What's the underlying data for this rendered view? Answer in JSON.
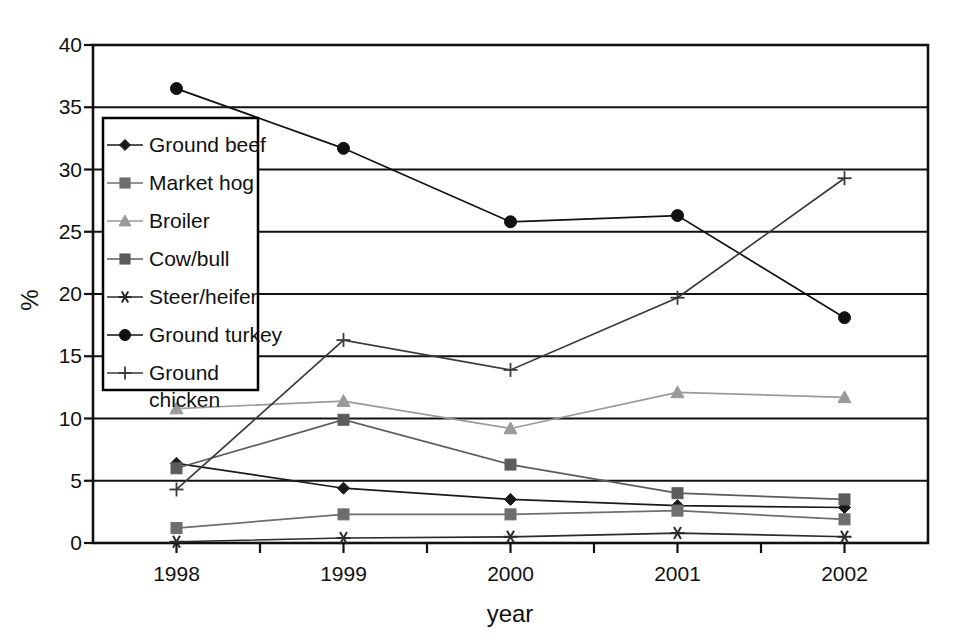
{
  "chart_data": {
    "type": "line",
    "title": "",
    "xlabel": "year",
    "ylabel": "%",
    "categories": [
      "1998",
      "1999",
      "2000",
      "2001",
      "2002"
    ],
    "x": [
      1998,
      1999,
      2000,
      2001,
      2002
    ],
    "xlim": [
      1997.5,
      2002.5
    ],
    "ylim": [
      0,
      40
    ],
    "yticks": [
      0,
      5,
      10,
      15,
      20,
      25,
      30,
      35,
      40
    ],
    "ytick_labels": [
      "0",
      "5",
      "10",
      "15",
      "20",
      "25",
      "30",
      "35",
      "40"
    ],
    "xtick_labels": [
      "1998",
      "1999",
      "2000",
      "2001",
      "2002"
    ],
    "grid": "horizontal",
    "legend_position": "inside-left",
    "series": [
      {
        "name": "Ground beef",
        "marker": "diamond",
        "color": "#1a1a1a",
        "values": [
          6.4,
          4.4,
          3.5,
          3.0,
          2.85
        ]
      },
      {
        "name": "Market hog",
        "marker": "square",
        "color": "#6e6e6e",
        "values": [
          1.2,
          2.3,
          2.3,
          2.6,
          1.9
        ]
      },
      {
        "name": "Broiler",
        "marker": "triangle",
        "color": "#9a9a9a",
        "values": [
          10.8,
          11.4,
          9.2,
          12.1,
          11.7
        ]
      },
      {
        "name": "Cow/bull",
        "marker": "square",
        "color": "#5c5c5c",
        "values": [
          6.0,
          9.9,
          6.3,
          4.0,
          3.5
        ]
      },
      {
        "name": "Steer/heifer",
        "marker": "star",
        "color": "#2b2b2b",
        "values": [
          0.1,
          0.4,
          0.5,
          0.8,
          0.5
        ]
      },
      {
        "name": "Ground turkey",
        "marker": "circle",
        "color": "#111111",
        "values": [
          36.5,
          31.7,
          25.8,
          26.3,
          18.1
        ]
      },
      {
        "name": "Ground chicken",
        "marker": "plus",
        "color": "#3a3a3a",
        "values": [
          4.3,
          16.3,
          13.9,
          19.7,
          29.3
        ]
      }
    ]
  },
  "legend": {
    "entries": [
      {
        "label": "Ground beef"
      },
      {
        "label": "Market hog"
      },
      {
        "label": "Broiler"
      },
      {
        "label": "Cow/bull"
      },
      {
        "label": "Steer/heifer"
      },
      {
        "label": "Ground turkey"
      },
      {
        "label": "Ground",
        "label2": "chicken"
      }
    ]
  }
}
